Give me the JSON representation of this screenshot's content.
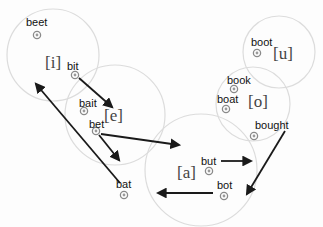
{
  "diagram": {
    "colors": {
      "region_stroke": "#dcdcdc",
      "arrow": "#1a1a1a",
      "marker": "#8a8a8a",
      "text": "#111111",
      "phoneme_text": "#444444"
    },
    "regions": [
      {
        "id": "i",
        "label": "[i]",
        "cx": 53,
        "cy": 55,
        "r": 46
      },
      {
        "id": "e",
        "label": "[e]",
        "cx": 115,
        "cy": 115,
        "r": 50
      },
      {
        "id": "a",
        "label": "[a]",
        "cx": 201,
        "cy": 170,
        "r": 56
      },
      {
        "id": "o",
        "label": "[o]",
        "cx": 253,
        "cy": 104,
        "r": 37
      },
      {
        "id": "u",
        "label": "[u]",
        "cx": 279,
        "cy": 52,
        "r": 36
      }
    ],
    "phoneme_labels": [
      {
        "text": "[i]",
        "x": 45,
        "y": 68
      },
      {
        "text": "[e]",
        "x": 104,
        "y": 121
      },
      {
        "text": "[a]",
        "x": 177,
        "y": 178
      },
      {
        "text": "[o]",
        "x": 248,
        "y": 107
      },
      {
        "text": "[u]",
        "x": 273,
        "y": 59
      }
    ],
    "words": [
      {
        "text": "beet",
        "label_x": 26,
        "label_y": 26,
        "mx": 37,
        "my": 35
      },
      {
        "text": "bit",
        "label_x": 67,
        "label_y": 70,
        "mx": 75,
        "my": 75
      },
      {
        "text": "bait",
        "label_x": 79,
        "label_y": 107,
        "mx": 84,
        "my": 111
      },
      {
        "text": "bet",
        "label_x": 89,
        "label_y": 128,
        "mx": 96,
        "my": 131
      },
      {
        "text": "bat",
        "label_x": 116,
        "label_y": 188,
        "mx": 124,
        "my": 195
      },
      {
        "text": "but",
        "label_x": 201,
        "label_y": 165,
        "mx": 209,
        "my": 171
      },
      {
        "text": "bot",
        "label_x": 217,
        "label_y": 189,
        "mx": 224,
        "my": 196
      },
      {
        "text": "boot",
        "label_x": 251,
        "label_y": 46,
        "mx": 257,
        "my": 53
      },
      {
        "text": "book",
        "label_x": 227,
        "label_y": 84,
        "mx": 234,
        "my": 89
      },
      {
        "text": "boat",
        "label_x": 217,
        "label_y": 103,
        "mx": 226,
        "my": 109
      },
      {
        "text": "bought",
        "label_x": 255,
        "label_y": 129,
        "mx": 254,
        "my": 136
      }
    ],
    "arrows": [
      {
        "from": "bit",
        "x1": 79,
        "y1": 78,
        "x2": 112,
        "y2": 107
      },
      {
        "from": "bat",
        "x1": 120,
        "y1": 183,
        "x2": 36,
        "y2": 84
      },
      {
        "from": "bet",
        "x1": 99,
        "y1": 135,
        "x2": 119,
        "y2": 160
      },
      {
        "from": "bet",
        "x1": 101,
        "y1": 134,
        "x2": 179,
        "y2": 145
      },
      {
        "from": "but",
        "x1": 221,
        "y1": 161,
        "x2": 251,
        "y2": 161
      },
      {
        "from": "bot",
        "x1": 213,
        "y1": 193,
        "x2": 158,
        "y2": 193
      },
      {
        "from": "bought",
        "x1": 285,
        "y1": 131,
        "x2": 247,
        "y2": 194
      }
    ]
  }
}
